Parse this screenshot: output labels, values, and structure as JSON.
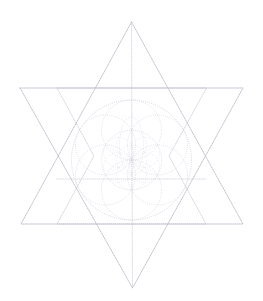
{
  "figure": {
    "alt_name": "hexagram-flower-of-life-diagram",
    "width": 263,
    "height": 301,
    "background_color": "#ffffff",
    "line_color": "#b9b6c4",
    "secondary_line_color": "#d2cfdd",
    "line_style": "dotted",
    "center": {
      "x": 131.5,
      "y": 156.0
    }
  },
  "chart_data": {
    "type": "diagram",
    "xlabel": "",
    "ylabel": "",
    "xlim": [
      0,
      263
    ],
    "ylim": [
      0,
      301
    ],
    "grid": false,
    "legend": "none",
    "shapes": [
      {
        "name": "upward-triangle",
        "kind": "polygon",
        "points": [
          [
            131.5,
            22
          ],
          [
            243,
            224
          ],
          [
            21,
            224
          ]
        ]
      },
      {
        "name": "downward-triangle",
        "kind": "polygon",
        "points": [
          [
            20,
            88
          ],
          [
            243,
            88
          ],
          [
            132.5,
            288
          ]
        ]
      },
      {
        "name": "inner-hexagon",
        "kind": "polygon",
        "points": [
          [
            131.5,
            88
          ],
          [
            206.5,
            88
          ],
          [
            169.0,
            156
          ],
          [
            206.0,
            224
          ],
          [
            131.5,
            224
          ],
          [
            57.0,
            224
          ],
          [
            94.0,
            156
          ],
          [
            57.0,
            88
          ]
        ]
      },
      {
        "name": "vertical-axis",
        "kind": "line",
        "points": [
          [
            131.5,
            22
          ],
          [
            132.5,
            288
          ]
        ]
      },
      {
        "name": "horizontal-mid-axis",
        "kind": "line",
        "points": [
          [
            57,
            179
          ],
          [
            206,
            179
          ]
        ]
      }
    ],
    "circles": [
      {
        "name": "outer-circle",
        "cx": 131.5,
        "cy": 160.0,
        "r": 60.0
      },
      {
        "name": "seed-circle-center",
        "cx": 131.5,
        "cy": 160.0,
        "r": 30.0
      },
      {
        "name": "seed-circle-n",
        "cx": 131.5,
        "cy": 130.0,
        "r": 30.0
      },
      {
        "name": "seed-circle-ne",
        "cx": 157.5,
        "cy": 145.0,
        "r": 30.0
      },
      {
        "name": "seed-circle-se",
        "cx": 157.5,
        "cy": 175.0,
        "r": 30.0
      },
      {
        "name": "seed-circle-s",
        "cx": 131.5,
        "cy": 190.0,
        "r": 30.0
      },
      {
        "name": "seed-circle-sw",
        "cx": 105.5,
        "cy": 175.0,
        "r": 30.0
      },
      {
        "name": "seed-circle-nw",
        "cx": 105.5,
        "cy": 145.0,
        "r": 30.0
      }
    ],
    "vertices": {
      "top_apex": [
        131.5,
        22
      ],
      "bottom_apex": [
        132.5,
        288
      ],
      "upper_left": [
        20,
        88
      ],
      "upper_right": [
        243,
        88
      ],
      "lower_left": [
        21,
        224
      ],
      "lower_right": [
        243,
        224
      ]
    },
    "annotations": []
  }
}
